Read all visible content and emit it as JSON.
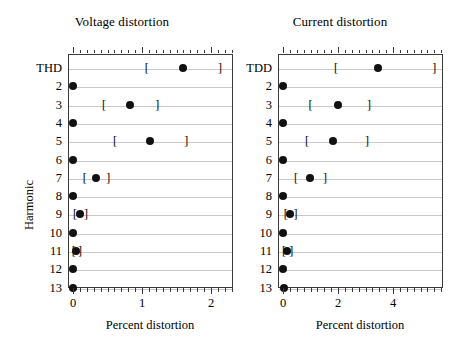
{
  "figure": {
    "width": 458,
    "height": 350,
    "background": "#ffffff",
    "dot_color": "#111111",
    "grid_color": "#c9c9c9",
    "axis_color": "#3a3a3a",
    "yaxis_title": "Harmonic"
  },
  "chart_data": [
    {
      "type": "scatter",
      "panel_id": "voltage",
      "title": "Voltage distortion",
      "xlabel": "Percent distortion",
      "ylabel": "Harmonic",
      "xlim": [
        -0.07,
        2.32
      ],
      "xticks": [
        0,
        1,
        2
      ],
      "xtick_labels": [
        "0",
        "1",
        "2"
      ],
      "xtick_minor_step": 0.1,
      "categories": [
        "THD",
        "2",
        "3",
        "4",
        "5",
        "6",
        "7",
        "8",
        "9",
        "10",
        "11",
        "12",
        "13"
      ],
      "grid": "horizontal",
      "legend": "none",
      "points": [
        {
          "category": "THD",
          "value": 1.59,
          "lower": 1.07,
          "upper": 2.13
        },
        {
          "category": "2",
          "value": 0.0,
          "lower": null,
          "upper": null
        },
        {
          "category": "3",
          "value": 0.83,
          "lower": 0.45,
          "upper": 1.22
        },
        {
          "category": "4",
          "value": 0.0,
          "lower": null,
          "upper": null
        },
        {
          "category": "5",
          "value": 1.12,
          "lower": 0.61,
          "upper": 1.64
        },
        {
          "category": "6",
          "value": 0.0,
          "lower": null,
          "upper": null
        },
        {
          "category": "7",
          "value": 0.33,
          "lower": 0.17,
          "upper": 0.51
        },
        {
          "category": "8",
          "value": 0.0,
          "lower": null,
          "upper": null
        },
        {
          "category": "9",
          "value": 0.1,
          "lower": 0.03,
          "upper": 0.19
        },
        {
          "category": "10",
          "value": 0.0,
          "lower": null,
          "upper": null
        },
        {
          "category": "11",
          "value": 0.045,
          "lower": 0.01,
          "upper": 0.1
        },
        {
          "category": "12",
          "value": 0.0,
          "lower": null,
          "upper": null
        },
        {
          "category": "13",
          "value": 0.0,
          "lower": null,
          "upper": null
        }
      ]
    },
    {
      "type": "scatter",
      "panel_id": "current",
      "title": "Current distortion",
      "xlabel": "Percent distortion",
      "ylabel": "Harmonic",
      "xlim": [
        -0.18,
        5.82
      ],
      "xticks": [
        0,
        2,
        4
      ],
      "xtick_labels": [
        "0",
        "2",
        "4"
      ],
      "xtick_minor_step": 0.25,
      "categories": [
        "TDD",
        "2",
        "3",
        "4",
        "5",
        "6",
        "7",
        "8",
        "9",
        "10",
        "11",
        "12",
        "13"
      ],
      "grid": "horizontal",
      "legend": "none",
      "points": [
        {
          "category": "TDD",
          "value": 3.45,
          "lower": 1.93,
          "upper": 5.5
        },
        {
          "category": "2",
          "value": 0.0,
          "lower": null,
          "upper": null
        },
        {
          "category": "3",
          "value": 2.0,
          "lower": 1.0,
          "upper": 3.13
        },
        {
          "category": "4",
          "value": 0.0,
          "lower": null,
          "upper": null
        },
        {
          "category": "5",
          "value": 1.82,
          "lower": 0.87,
          "upper": 3.05
        },
        {
          "category": "6",
          "value": 0.0,
          "lower": null,
          "upper": null
        },
        {
          "category": "7",
          "value": 0.98,
          "lower": 0.47,
          "upper": 1.53
        },
        {
          "category": "8",
          "value": 0.0,
          "lower": null,
          "upper": null
        },
        {
          "category": "9",
          "value": 0.26,
          "lower": 0.1,
          "upper": 0.45
        },
        {
          "category": "10",
          "value": 0.0,
          "lower": null,
          "upper": null
        },
        {
          "category": "11",
          "value": 0.15,
          "lower": 0.04,
          "upper": 0.3
        },
        {
          "category": "12",
          "value": 0.0,
          "lower": null,
          "upper": null
        },
        {
          "category": "13",
          "value": 0.02,
          "lower": null,
          "upper": null
        }
      ]
    }
  ],
  "brackets": {
    "left_glyph": "[",
    "right_glyph": "]"
  },
  "geometry": {
    "panels": [
      {
        "plot_left": 68,
        "plot_right": 233,
        "plot_top": 54,
        "plot_bottom": 288,
        "x0_px": 73,
        "x_unit_px": 69,
        "title_left": 0,
        "title_width": 244,
        "xlabel_cx": 150,
        "xlabel_y": 318
      },
      {
        "plot_left": 278,
        "plot_right": 443,
        "plot_top": 54,
        "plot_bottom": 288,
        "x0_px": 283,
        "x_unit_px": 27.5,
        "title_left": 222,
        "title_width": 236,
        "xlabel_cx": 360,
        "xlabel_y": 318
      }
    ],
    "row_top": 68,
    "row_step": 18.3,
    "ylabel_x": 22,
    "ylabel_y": 230
  }
}
